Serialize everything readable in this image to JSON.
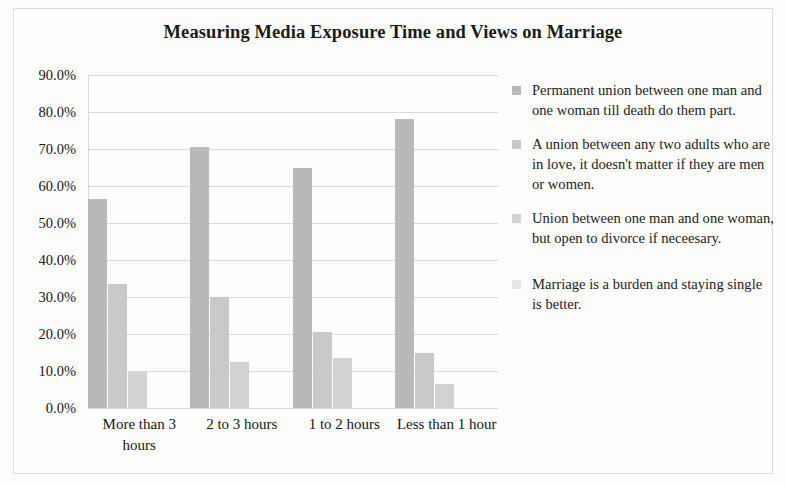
{
  "chart_data": {
    "type": "bar",
    "title": "Measuring Media Exposure Time and Views on Marriage",
    "xlabel": "",
    "ylabel": "",
    "ylim": [
      0,
      90
    ],
    "ytick_labels": [
      "90.0%",
      "80.0%",
      "70.0%",
      "60.0%",
      "50.0%",
      "40.0%",
      "30.0%",
      "20.0%",
      "10.0%",
      "0.0%"
    ],
    "ytick_values": [
      90,
      80,
      70,
      60,
      50,
      40,
      30,
      20,
      10,
      0
    ],
    "grid": true,
    "legend_position": "right",
    "categories": [
      "More than 3 hours",
      "2 to 3 hours",
      "1 to 2 hours",
      "Less than 1 hour"
    ],
    "series": [
      {
        "name": "Permanent union between one man and one woman till death do them part.",
        "color": "#b9b9b9",
        "values": [
          56.5,
          70.5,
          65.0,
          78.0
        ]
      },
      {
        "name": "A union between any two adults who are in love, it doesn't matter if they are men or women.",
        "color": "#c9c9c9",
        "values": [
          33.5,
          30.0,
          20.5,
          15.0
        ]
      },
      {
        "name": "Union between one man and one woman, but open to divorce if neceesary.",
        "color": "#d2d2d2",
        "values": [
          10.0,
          12.5,
          13.5,
          6.5
        ]
      },
      {
        "name": "Marriage is a burden and staying single is better.",
        "color": "#e6e6e6",
        "values": [
          0.0,
          0.0,
          0.0,
          0.0
        ]
      }
    ]
  },
  "colors": {
    "gridline": "#d9d9d9",
    "text": "#141414",
    "background": "#fdfdfc"
  }
}
